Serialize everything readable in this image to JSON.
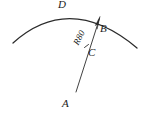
{
  "figure": {
    "type": "geometric-arc-diagram",
    "background_color": "#ffffff",
    "stroke_color": "#2b2b2b",
    "labels": {
      "arc_apex": "D",
      "arc_endpoint": "B",
      "midpoint": "C",
      "origin": "A",
      "radius_dimension": "R80"
    },
    "geometry": {
      "arc": {
        "start_x": 13,
        "start_y": 43,
        "apex_x": 70,
        "apex_y": 10,
        "end_x": 137,
        "end_y": 48
      },
      "radius_line": {
        "from_x": 76,
        "from_y": 92,
        "to_x": 100,
        "to_y": 17
      },
      "tick_c_x": 87,
      "tick_c_y": 46,
      "arrow_tip_x": 100,
      "arrow_tip_y": 17
    }
  }
}
